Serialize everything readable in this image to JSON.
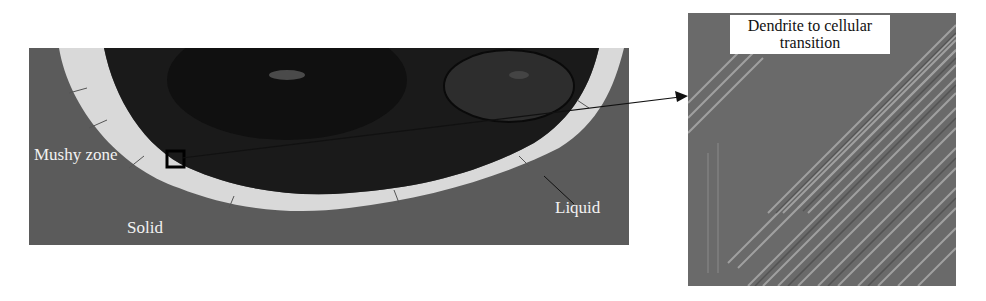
{
  "figure": {
    "left_panel": {
      "labels": {
        "mushy_zone": "Mushy zone",
        "solid": "Solid",
        "liquid": "Liquid"
      }
    },
    "right_panel": {
      "callout_line1": "Dendrite to cellular",
      "callout_line2": "transition"
    },
    "colors": {
      "solid_region": "#5b5b5b",
      "mushy_band": "#d9d9d9",
      "liquid_core": "#161616",
      "micrograph_bg": "#6a6a6a",
      "arrow": "#111111"
    }
  }
}
